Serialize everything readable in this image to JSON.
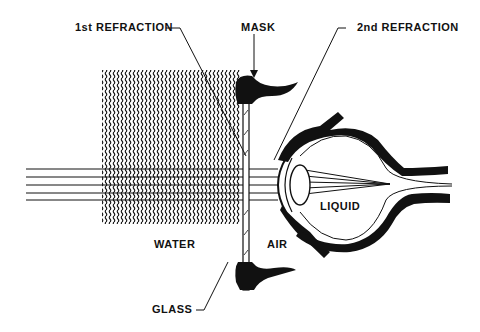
{
  "diagram": {
    "labels": {
      "first_refraction": "1st REFRACTION",
      "mask": "MASK",
      "second_refraction": "2nd REFRACTION",
      "water": "WATER",
      "air": "AIR",
      "liquid": "LIQUID",
      "glass": "GLASS"
    },
    "colors": {
      "ink": "#111111",
      "background": "#ffffff"
    }
  }
}
